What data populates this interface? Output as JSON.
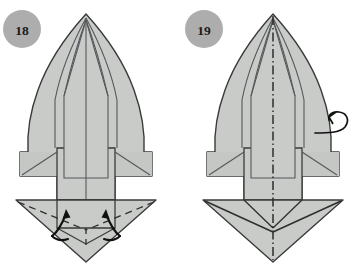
{
  "document": {
    "type": "origami-instruction-diagram",
    "background_color": "#ffffff",
    "paper_fill": "#c9cbc9",
    "paper_fill_shade": "#bfc2bf",
    "outline_color": "#3a3a3a",
    "crease_color": "#55585a",
    "arrow_color": "#111111",
    "badge_fill": "#adadad",
    "badge_text_color": "#1b1b1b"
  },
  "figures": [
    {
      "id": "figure-18",
      "step_number": "18",
      "badge": {
        "cx": 22,
        "cy": 29,
        "r": 19
      },
      "has_center_axis": false,
      "axis_style": "none",
      "fold_arrows": [
        {
          "name": "left-valley-fold-arrow",
          "direction": "up-inward"
        },
        {
          "name": "right-valley-fold-arrow",
          "direction": "up-inward"
        }
      ],
      "dashed_creases": [
        "left-wing-valley-crease",
        "right-wing-valley-crease",
        "center-vertical-crease"
      ],
      "turn_over_arrow": false
    },
    {
      "id": "figure-19",
      "step_number": "19",
      "badge": {
        "cx": 204,
        "cy": 29,
        "r": 19
      },
      "has_center_axis": true,
      "axis_style": "dash-dot",
      "fold_arrows": [],
      "dashed_creases": [],
      "turn_over_arrow": true,
      "turn_over_arrow_name": "turn-over-loop-arrow"
    }
  ]
}
